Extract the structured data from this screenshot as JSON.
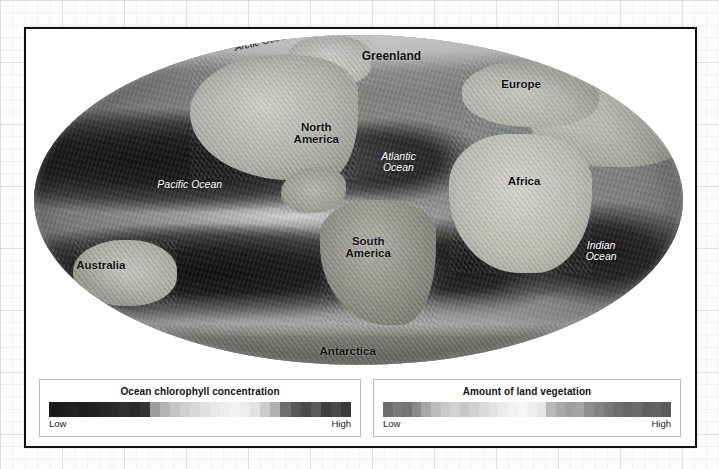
{
  "figure": {
    "type": "global-biosphere-map",
    "projection": "Mollweide ellipse"
  },
  "map": {
    "labels": [
      {
        "id": "arctic-ocean",
        "text": "Arctic Ocean",
        "style": "dark-italic",
        "left": "33%",
        "top": "2%"
      },
      {
        "id": "greenland",
        "text": "Greenland",
        "style": "dark-bold",
        "left": "49%",
        "top": "5%"
      },
      {
        "id": "europe",
        "text": "Europe",
        "style": "dark-bold",
        "left": "70%",
        "top": "13%"
      },
      {
        "id": "north-america",
        "text": "North\nAmerica",
        "style": "dark-bold",
        "left": "40%",
        "top": "26%"
      },
      {
        "id": "atlantic-ocean",
        "text": "Atlantic\nOcean",
        "style": "light-italic",
        "left": "54%",
        "top": "35%"
      },
      {
        "id": "pacific-ocean",
        "text": "Pacific Ocean",
        "style": "light-italic",
        "left": "18%",
        "top": "44%"
      },
      {
        "id": "africa",
        "text": "Africa",
        "style": "dark-bold",
        "left": "72%",
        "top": "42%"
      },
      {
        "id": "south-america",
        "text": "South\nAmerica",
        "style": "dark-bold",
        "left": "49%",
        "top": "62%"
      },
      {
        "id": "indian-ocean",
        "text": "Indian\nOcean",
        "style": "light-italic",
        "left": "86%",
        "top": "63%"
      },
      {
        "id": "australia",
        "text": "Australia",
        "style": "dark-bold",
        "left": "7%",
        "top": "68%"
      },
      {
        "id": "antarctica",
        "text": "Antarctica",
        "style": "dark-bold",
        "left": "47%",
        "top": "95%"
      }
    ],
    "label_text": {
      "arctic_ocean": "Arctic Ocean",
      "greenland": "Greenland",
      "europe": "Europe",
      "north_america_line1": "North",
      "north_america_line2": "America",
      "atlantic_ocean_line1": "Atlantic",
      "atlantic_ocean_line2": "Ocean",
      "pacific_ocean": "Pacific Ocean",
      "africa": "Africa",
      "south_america_line1": "South",
      "south_america_line2": "America",
      "indian_ocean_line1": "Indian",
      "indian_ocean_line2": "Ocean",
      "australia": "Australia",
      "antarctica": "Antarctica"
    }
  },
  "legends": {
    "ocean": {
      "title": "Ocean chlorophyll concentration",
      "low_label": "Low",
      "high_label": "High",
      "ramp_colors": [
        "#1b1b1b",
        "#1e1e1e",
        "#232323",
        "#1d1d1d",
        "#212121",
        "#262626",
        "#2a2a2a",
        "#303030",
        "#2b2b2b",
        "#343434",
        "#9c9c9c",
        "#b4b4b4",
        "#c4c4c4",
        "#cfcfcf",
        "#d8d8d8",
        "#e0e0e0",
        "#e8e8e8",
        "#eeeeee",
        "#f2f2f2",
        "#ededed",
        "#e2e2e2",
        "#cccccc",
        "#b0b0b0",
        "#6e6e6e",
        "#565656",
        "#4b4b4b",
        "#5a5a5a",
        "#3f3f3f",
        "#4a4a4a",
        "#3a3a3a"
      ]
    },
    "land": {
      "title": "Amount of land vegetation",
      "low_label": "Low",
      "high_label": "High",
      "ramp_colors": [
        "#6f6f6f",
        "#7b7b7b",
        "#747474",
        "#8a8a8a",
        "#a7a7a7",
        "#bdbdbd",
        "#c9c9c9",
        "#d2d2d2",
        "#c6c6c6",
        "#d0d0d0",
        "#dadada",
        "#e2e2e2",
        "#ececec",
        "#f2f2f2",
        "#f6f6f6",
        "#efefef",
        "#e6e6e6",
        "#b9b9b9",
        "#a9a9a9",
        "#9f9f9f",
        "#a4a4a4",
        "#8e8e8e",
        "#838383",
        "#787878",
        "#6e6e6e",
        "#666666",
        "#6b6b6b",
        "#5f5f5f",
        "#646464",
        "#5a5a5a"
      ]
    }
  },
  "colors": {
    "panel_border": "#111111",
    "panel_background": "#ffffff",
    "legend_border": "#b9b9b9",
    "label_dark": "#111111",
    "label_light": "#ffffff",
    "page_background": "#fcfcfc"
  }
}
